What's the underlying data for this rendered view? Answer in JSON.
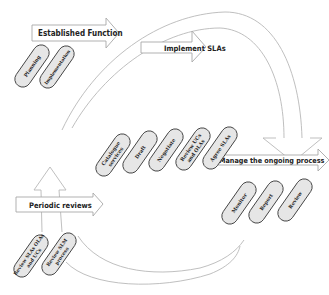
{
  "diagram": {
    "colors": {
      "arrow_fill": "#ffffff",
      "arrow_stroke": "#a8a8a8",
      "pill_fill": "#e6e6e6",
      "pill_stroke": "#444444",
      "text": "#222222",
      "curve": "#b8b8b8"
    },
    "stages": [
      {
        "id": "established",
        "label": "Established Function",
        "steps": [
          {
            "lines": [
              "Planning"
            ]
          },
          {
            "lines": [
              "Implementation"
            ]
          }
        ]
      },
      {
        "id": "implement",
        "label": "Implement SLAs",
        "steps": [
          {
            "lines": [
              "Catalogue",
              "services"
            ]
          },
          {
            "lines": [
              "Draft"
            ]
          },
          {
            "lines": [
              "Negotiate"
            ]
          },
          {
            "lines": [
              "Review UCs",
              "and OLAs"
            ]
          },
          {
            "lines": [
              "Agree SLAs"
            ]
          }
        ]
      },
      {
        "id": "manage",
        "label": "Manage the ongoing process",
        "steps": [
          {
            "lines": [
              "Monitor"
            ]
          },
          {
            "lines": [
              "Report"
            ]
          },
          {
            "lines": [
              "Review"
            ]
          }
        ]
      },
      {
        "id": "periodic",
        "label": "Periodic reviews",
        "steps": [
          {
            "lines": [
              "Review SLAs OLAs",
              "and UCs"
            ]
          },
          {
            "lines": [
              "Review SLM",
              "process"
            ]
          }
        ]
      }
    ]
  }
}
